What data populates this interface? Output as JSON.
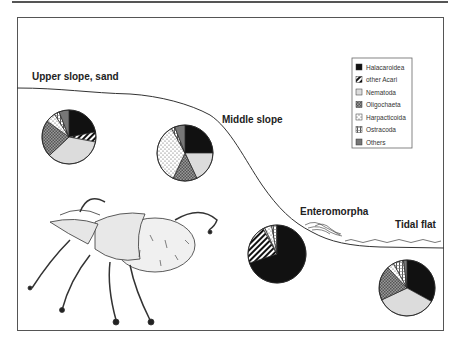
{
  "legend": {
    "items": [
      {
        "label": "Halacaroidea",
        "pattern": "solid-black"
      },
      {
        "label": "other Acari",
        "pattern": "diagonal-hatch"
      },
      {
        "label": "Nematoda",
        "pattern": "light-gray"
      },
      {
        "label": "Oligochaeta",
        "pattern": "cross-hatch"
      },
      {
        "label": "Harpacticoida",
        "pattern": "dots"
      },
      {
        "label": "Ostracoda",
        "pattern": "vertical-hatch"
      },
      {
        "label": "Others",
        "pattern": "dark-gray"
      }
    ]
  },
  "labels": {
    "upper": "Upper slope, sand",
    "middle": "Middle slope",
    "enteromorpha": "Enteromorpha",
    "tidal": "Tidal flat"
  },
  "illustration": {
    "subject": "mite-drawing"
  },
  "chart_data": {
    "type": "pie",
    "title": "",
    "categories": [
      "Halacaroidea",
      "other Acari",
      "Nematoda",
      "Oligochaeta",
      "Harpacticoida",
      "Ostracoda",
      "Others"
    ],
    "series": [
      {
        "name": "Upper slope, sand",
        "values": [
          22,
          6,
          35,
          22,
          6,
          3,
          6
        ]
      },
      {
        "name": "Middle slope",
        "values": [
          25,
          0,
          18,
          14,
          35,
          2,
          6
        ]
      },
      {
        "name": "Enteromorpha",
        "values": [
          70,
          22,
          1,
          0,
          4,
          3,
          0
        ]
      },
      {
        "name": "Tidal flat",
        "values": [
          33,
          0,
          35,
          20,
          4,
          6,
          2
        ]
      }
    ],
    "legend_position": "upper-right"
  }
}
